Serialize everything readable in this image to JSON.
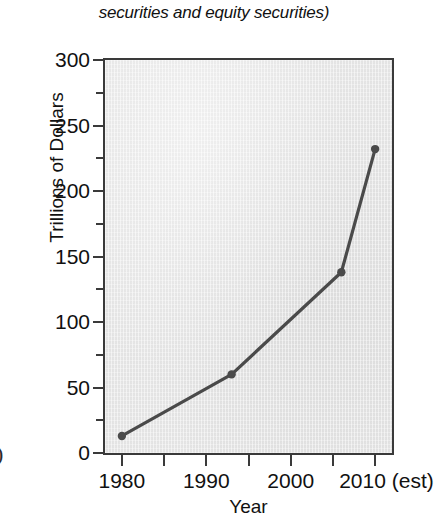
{
  "caption": {
    "text": "securities and equity securities)"
  },
  "artifact": {
    "glyph": ")"
  },
  "colors": {
    "line": "#4a4a4a",
    "marker": "#4a4a4a",
    "plot_background": "#e9e9e9",
    "axis": "#3a3a3a",
    "text": "#111111",
    "page_background": "#ffffff"
  },
  "chart_data": {
    "type": "line",
    "title": "",
    "xlabel": "Year",
    "ylabel": "Trillions of Dollars",
    "xlim": [
      1978,
      2012
    ],
    "ylim": [
      0,
      300
    ],
    "grid": false,
    "legend": "none",
    "x": [
      1980,
      1993,
      2006,
      2010
    ],
    "values": [
      13,
      60,
      138,
      232
    ],
    "series": [
      {
        "name": "Total securities outstanding",
        "x": [
          1980,
          1993,
          2006,
          2010
        ],
        "values": [
          13,
          60,
          138,
          232
        ]
      }
    ],
    "y_tick_labels": [
      "0",
      "50",
      "100",
      "150",
      "200",
      "250",
      "300"
    ],
    "y_ticks": [
      0,
      50,
      100,
      150,
      200,
      250,
      300
    ],
    "y_minor_ticks": [
      25,
      75,
      125,
      175,
      225,
      275
    ],
    "x_tick_labels": [
      "1980",
      "1990",
      "2000",
      "2010 (est)"
    ],
    "x_labeled_ticks": [
      1980,
      1990,
      2000,
      2010
    ],
    "x_ticks": [
      1980,
      1985,
      1990,
      1995,
      2000,
      2005,
      2010
    ],
    "x_last_tick_note": "(est)"
  }
}
